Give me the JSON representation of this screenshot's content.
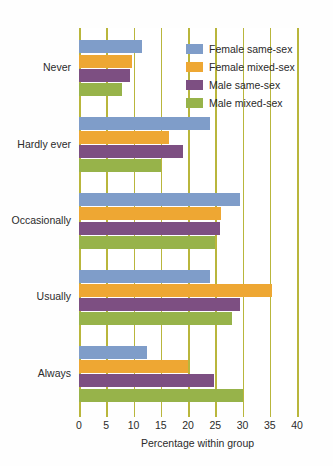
{
  "chart_data": {
    "type": "bar",
    "orientation": "horizontal",
    "title": "",
    "xlabel": "Percentage within group",
    "ylabel": "",
    "xlim": [
      0,
      40
    ],
    "xticks": [
      0,
      5,
      10,
      15,
      20,
      25,
      30,
      35,
      40
    ],
    "xtick_labels": [
      "0",
      "5",
      "10",
      "15",
      "20",
      "25",
      "30",
      "35",
      "40"
    ],
    "grid": true,
    "grid_axis": "x",
    "legend_position": "top-right",
    "categories": [
      "Never",
      "Hardly ever",
      "Occasionally",
      "Usually",
      "Always"
    ],
    "series": [
      {
        "name": "Female same-sex",
        "color": "#7f9dc9",
        "values": [
          11.5,
          24.0,
          29.5,
          24.0,
          12.5
        ]
      },
      {
        "name": "Female mixed-sex",
        "color": "#eea733",
        "values": [
          9.7,
          16.5,
          26.0,
          35.5,
          20.0
        ]
      },
      {
        "name": "Male same-sex",
        "color": "#7d4f82",
        "values": [
          9.4,
          19.0,
          25.8,
          29.5,
          24.7
        ]
      },
      {
        "name": "Male mixed-sex",
        "color": "#97b34a",
        "values": [
          7.9,
          15.0,
          25.0,
          28.0,
          30.0
        ]
      }
    ],
    "colors": {
      "gridline": "#b9b63c",
      "background": "#ffffff",
      "text": "#2b2b2b"
    }
  }
}
